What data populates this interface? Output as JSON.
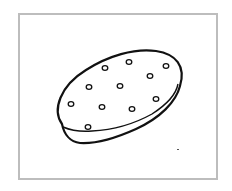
{
  "illustration": {
    "subject": "cracker",
    "description": "Line drawing of an oval cracker with small holes, inside a gray frame",
    "colors": {
      "frame_border": "#bdbdbd",
      "line": "#111111",
      "background": "#ffffff"
    },
    "holes": [
      {
        "cx": 105,
        "cy": 68
      },
      {
        "cx": 129,
        "cy": 62
      },
      {
        "cx": 166,
        "cy": 66
      },
      {
        "cx": 150,
        "cy": 76
      },
      {
        "cx": 89,
        "cy": 87
      },
      {
        "cx": 120,
        "cy": 86
      },
      {
        "cx": 71,
        "cy": 104
      },
      {
        "cx": 102,
        "cy": 107
      },
      {
        "cx": 132,
        "cy": 109
      },
      {
        "cx": 156,
        "cy": 99
      },
      {
        "cx": 88,
        "cy": 127
      }
    ]
  }
}
